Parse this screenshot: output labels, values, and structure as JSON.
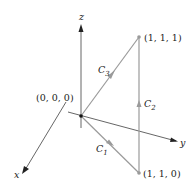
{
  "diagram": {
    "type": "3d-path-diagram",
    "axes": {
      "x_label": "x",
      "y_label": "y",
      "z_label": "z"
    },
    "points": [
      {
        "name": "origin",
        "label": "(0, 0, 0)"
      },
      {
        "name": "p111",
        "label": "(1, 1, 1)"
      },
      {
        "name": "p110",
        "label": "(1, 1, 0)"
      }
    ],
    "curves": [
      {
        "name": "C1",
        "letter": "C",
        "subscript": "1",
        "from": "(0, 0, 0)",
        "to": "(1, 1, 0)"
      },
      {
        "name": "C2",
        "letter": "C",
        "subscript": "2",
        "from": "(1, 1, 0)",
        "to": "(1, 1, 1)"
      },
      {
        "name": "C3",
        "letter": "C",
        "subscript": "3",
        "from": "(0, 0, 0)",
        "to": "(1, 1, 1)"
      }
    ],
    "colors": {
      "axis": "#222222",
      "path": "#9a9a9a",
      "background": "#ffffff"
    }
  }
}
